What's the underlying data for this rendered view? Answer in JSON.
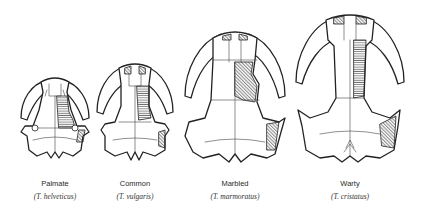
{
  "figure": {
    "species": [
      {
        "common_name": "Palmate",
        "latin_name": "(T. helveticus)",
        "center_x": 55
      },
      {
        "common_name": "Common",
        "latin_name": "(T. vulgaris)",
        "center_x": 135
      },
      {
        "common_name": "Marbled",
        "latin_name": "(T. marmoratus)",
        "center_x": 235
      },
      {
        "common_name": "Warty",
        "latin_name": "(T. cristatus)",
        "center_x": 350
      }
    ],
    "colors": {
      "line": "#222222",
      "background": "#ffffff",
      "label": "#2a2a2a"
    }
  }
}
